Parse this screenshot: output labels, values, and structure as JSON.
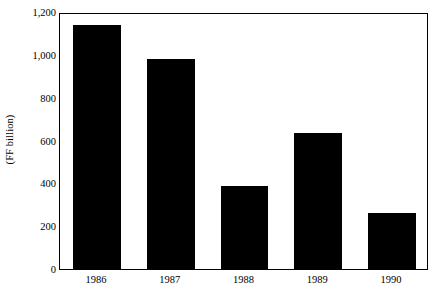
{
  "chart_data": {
    "type": "bar",
    "title": "",
    "subtitle": "",
    "xlabel": "",
    "ylabel": "(FF billion)",
    "categories": [
      "1986",
      "1987",
      "1988",
      "1989",
      "1990"
    ],
    "values": [
      1150,
      990,
      390,
      640,
      265
    ],
    "series": [
      {
        "name": "",
        "values": [
          1150,
          990,
          390,
          640,
          265
        ]
      }
    ],
    "ylim": [
      0,
      1200
    ],
    "xlim": [
      0,
      5
    ],
    "ytick_values": [
      0,
      200,
      400,
      600,
      800,
      1000,
      1200
    ],
    "ytick_labels": [
      "0",
      "200",
      "400",
      "600",
      "800",
      "1,000",
      "1,200"
    ],
    "xtick_labels": [
      "1986",
      "1987",
      "1988",
      "1989",
      "1990"
    ],
    "grid": false,
    "legend": false,
    "legend_position": "none",
    "bar_color": "#000000",
    "axis_color": "#000000",
    "background_color": "#ffffff",
    "annotations": []
  }
}
